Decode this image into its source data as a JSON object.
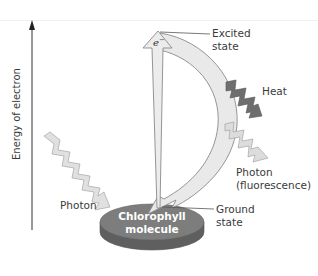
{
  "diagram": {
    "axis": {
      "label": "Energy of electron",
      "direction": "up"
    },
    "labels": {
      "electron": "e",
      "electron_sup": "−",
      "excited_state_line1": "Excited",
      "excited_state_line2": "state",
      "heat": "Heat",
      "photon_out_line1": "Photon",
      "photon_out_line2": "(fluorescence)",
      "photon_in": "Photon",
      "molecule_line1": "Chlorophyll",
      "molecule_line2": "molecule",
      "ground_state_line1": "Ground",
      "ground_state_line2": "state"
    },
    "colors": {
      "molecule_top": "#7d7d7d",
      "molecule_side": "#5f5f5f",
      "arrow_fill": "#e9e9e9",
      "arrow_stroke": "#8a8a8a",
      "heat_fill": "#6e6e6e",
      "photon_fill": "#dcdcdc",
      "text": "#3a3a3a"
    }
  }
}
